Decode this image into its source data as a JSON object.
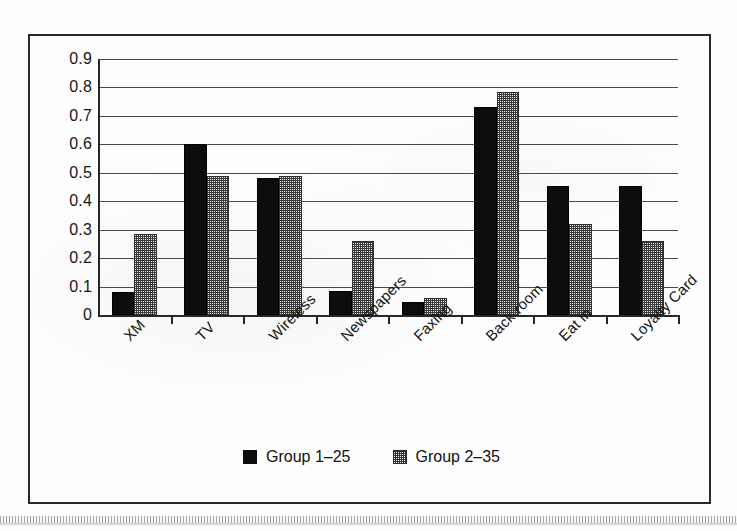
{
  "chart_data": {
    "type": "bar",
    "title": "",
    "subtitle": "",
    "xlabel": "",
    "ylabel": "",
    "ylim": [
      0,
      0.9
    ],
    "y_ticks": [
      "0",
      "0.1",
      "0.2",
      "0.3",
      "0.4",
      "0.5",
      "0.6",
      "0.7",
      "0.8",
      "0.9"
    ],
    "y_tick_values": [
      0,
      0.1,
      0.2,
      0.3,
      0.4,
      0.5,
      0.6,
      0.7,
      0.8,
      0.9
    ],
    "grid": true,
    "grid_axis": "y",
    "legend_position": "bottom-center",
    "categories": [
      "XM",
      "TV",
      "Wireless",
      "Newspapers",
      "Faxing",
      "Back room",
      "Eat in",
      "Loyalty Card"
    ],
    "series": [
      {
        "name": "Group 1-25",
        "color": "#0d0d0d",
        "values": [
          0.08,
          0.6,
          0.48,
          0.085,
          0.045,
          0.73,
          0.455,
          0.455
        ]
      },
      {
        "name": "Group 2-35",
        "color": "#9a9a9a",
        "values": [
          0.285,
          0.49,
          0.49,
          0.26,
          0.06,
          0.785,
          0.32,
          0.26
        ]
      }
    ]
  },
  "legend": {
    "items": [
      {
        "label": "Group 1–25",
        "swatch": "black-square-marker"
      },
      {
        "label": "Group 2–35",
        "swatch": "checkered-square-marker"
      }
    ]
  },
  "colors": {
    "series_1": "#0d0d0d",
    "series_2": "#9a9a9a",
    "axis": "#272727",
    "gridline": "#4a4a4a",
    "frame": "#2a2a2a",
    "background": "#fefefe",
    "text": "#131313"
  }
}
